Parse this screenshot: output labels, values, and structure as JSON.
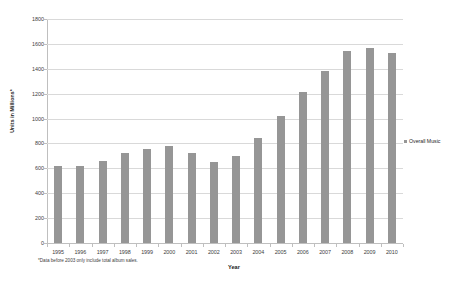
{
  "chart_data": {
    "type": "bar",
    "title": "",
    "xlabel": "Year",
    "ylabel": "Units in Millions*",
    "categories": [
      "1995",
      "1996",
      "1997",
      "1998",
      "1999",
      "2000",
      "2001",
      "2002",
      "2003",
      "2004",
      "2005",
      "2006",
      "2007",
      "2008",
      "2009",
      "2010"
    ],
    "series": [
      {
        "name": "Overall Music",
        "values": [
          615,
          618,
          660,
          720,
          755,
          780,
          725,
          655,
          700,
          840,
          1020,
          1215,
          1385,
          1545,
          1565,
          1525
        ]
      }
    ],
    "ylim": [
      0,
      1800
    ],
    "yticks": [
      0,
      200,
      400,
      600,
      800,
      1000,
      1200,
      1400,
      1600,
      1800
    ],
    "ytick_labels": [
      "0",
      "200",
      "400",
      "600",
      "800",
      "1000",
      "1200",
      "1400",
      "1600",
      "1800"
    ],
    "grid": true,
    "legend_position": "right",
    "bar_color": "#969696",
    "gridline_color": "#d9d9d9",
    "axis_color": "#bfbfbf"
  },
  "legend": {
    "entries": [
      {
        "label": "Overall Music",
        "color": "#969696",
        "marker": "square-swatch"
      }
    ]
  },
  "footnote": {
    "text": "*Data before 2003 only include total album sales."
  }
}
